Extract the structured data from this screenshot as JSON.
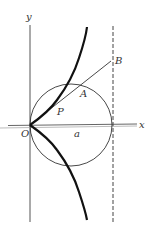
{
  "diagram": {
    "type": "cissoid-of-diocles-construction",
    "labels": {
      "y_axis": "y",
      "x_axis": "x",
      "origin": "O",
      "point_p": "P",
      "point_a": "A",
      "point_b": "B",
      "radius": "a"
    },
    "colors": {
      "stroke": "#222222",
      "axis": "#555555",
      "background": "#ffffff"
    },
    "elements": {
      "circle": {
        "cx": 71,
        "cy": 125,
        "r": 41
      },
      "asymptote": {
        "x": 113,
        "style": "dashed"
      },
      "secant_line": {
        "from": "O",
        "to": "B"
      }
    }
  }
}
